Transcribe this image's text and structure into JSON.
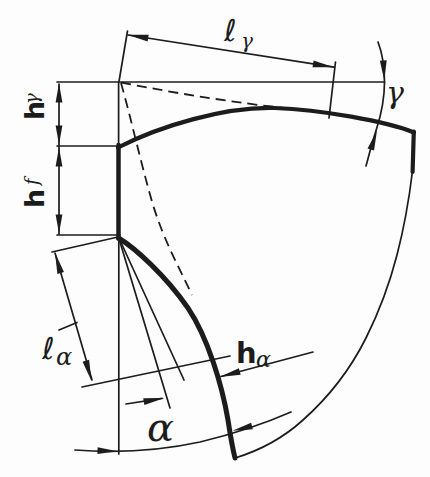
{
  "figure": {
    "colors": {
      "ink": "#1c1c1c",
      "background": "#fdfdfd"
    },
    "labels": {
      "l_gamma": {
        "main": "ℓ",
        "sub": "γ"
      },
      "gamma": "γ",
      "h_gamma": {
        "main": "h",
        "sub": "γ"
      },
      "h_f": {
        "main": "h",
        "sub": "f"
      },
      "l_alpha": {
        "main": "ℓ",
        "sub": "α"
      },
      "h_alpha": {
        "main": "h",
        "sub": "α"
      },
      "alpha": "α"
    }
  }
}
